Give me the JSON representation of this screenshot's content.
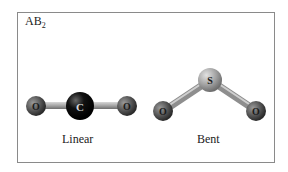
{
  "title": {
    "main": "AB",
    "subscript": "2"
  },
  "molecules": [
    {
      "name": "Linear",
      "atoms": [
        {
          "symbol": "O",
          "role": "terminal"
        },
        {
          "symbol": "C",
          "role": "central"
        },
        {
          "symbol": "O",
          "role": "terminal"
        }
      ]
    },
    {
      "name": "Bent",
      "atoms": [
        {
          "symbol": "O",
          "role": "terminal"
        },
        {
          "symbol": "S",
          "role": "central"
        },
        {
          "symbol": "O",
          "role": "terminal"
        }
      ]
    }
  ],
  "colors": {
    "oxygen": "#5a5a5a",
    "carbon": "#111111",
    "sulfur": "#a8a8a8",
    "bond": "#9a9a9a",
    "border": "#8a8a8a"
  }
}
